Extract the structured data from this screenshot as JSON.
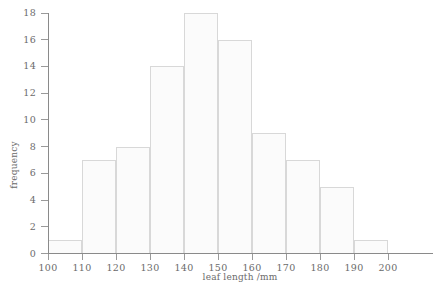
{
  "chart_data": {
    "type": "bar",
    "title": "",
    "subtitle": "",
    "xlabel": "leaf length /mm",
    "ylabel": "frequency",
    "categories": [
      "100-110",
      "110-120",
      "120-130",
      "130-140",
      "140-150",
      "150-160",
      "160-170",
      "170-180",
      "180-190",
      "190-200"
    ],
    "bin_edges": [
      100,
      110,
      120,
      130,
      140,
      150,
      160,
      170,
      180,
      190,
      200
    ],
    "values": [
      1,
      7,
      8,
      14,
      18,
      16,
      9,
      7,
      5,
      1
    ],
    "xlim": [
      100,
      200
    ],
    "ylim": [
      0,
      18
    ],
    "x_ticks": [
      100,
      110,
      120,
      130,
      140,
      150,
      160,
      170,
      180,
      190,
      200
    ],
    "y_ticks": [
      0,
      2,
      4,
      6,
      8,
      10,
      12,
      14,
      16,
      18
    ],
    "x_tick_labels": [
      "100",
      "110",
      "120",
      "130",
      "140",
      "150",
      "160",
      "170",
      "180",
      "190",
      "200"
    ],
    "y_tick_labels": [
      "0",
      "2",
      "4",
      "6",
      "8",
      "10",
      "12",
      "14",
      "16",
      "18"
    ],
    "grid": false,
    "legend": false,
    "legend_position": "none",
    "bar_fill_color": "#fbfbfb",
    "bar_border_color": "#d8d8d8",
    "axis_color": "#8a8a8a",
    "text_color": "#6b6b6b"
  },
  "axes": {
    "x_title": "leaf length /mm",
    "y_title": "frequency"
  }
}
